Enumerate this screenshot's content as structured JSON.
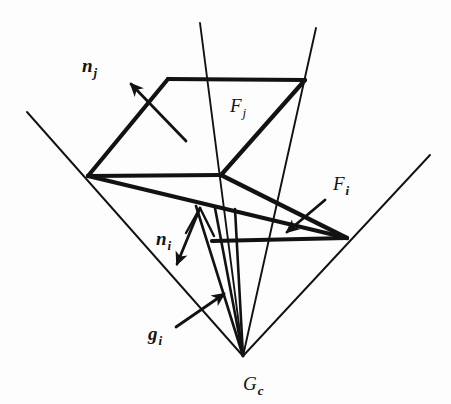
{
  "figure": {
    "background_color": "#fdfdfd",
    "ink_color": "#121212",
    "thick_stroke_width": 4.2,
    "thin_stroke_width": 1.9,
    "labels": [
      {
        "id": "n_j",
        "base": "n",
        "subscript": "j",
        "style": "bold-italic-base-italic-sub",
        "x": 82,
        "y": 72,
        "semantic": "normal-vector-face-j"
      },
      {
        "id": "F_j",
        "base": "F",
        "subscript": "j",
        "style": "italic-base-italic-sub",
        "x": 230,
        "y": 112,
        "semantic": "face-j"
      },
      {
        "id": "F_i",
        "base": "F",
        "subscript": "i",
        "style": "italic-base-bold-sub",
        "x": 333,
        "y": 190,
        "semantic": "face-i"
      },
      {
        "id": "n_i",
        "base": "n",
        "subscript": "i",
        "style": "bold-italic-base-bold-sub",
        "x": 156,
        "y": 245,
        "semantic": "normal-vector-face-i"
      },
      {
        "id": "g_i",
        "base": "g",
        "subscript": "i",
        "style": "bold-italic-base-bold-sub",
        "x": 148,
        "y": 340,
        "semantic": "grasp-direction-i"
      },
      {
        "id": "G_c",
        "base": "G",
        "subscript": "c",
        "style": "italic-base-bold-sub",
        "x": 243,
        "y": 390,
        "semantic": "grasp-center-apex"
      }
    ],
    "vertices": {
      "apex": [
        243,
        356
      ],
      "left": [
        88,
        176
      ],
      "center": [
        221,
        175
      ],
      "top_left": [
        168,
        79
      ],
      "top_right": [
        305,
        80
      ],
      "right": [
        347,
        238
      ],
      "lower_left": [
        212,
        241
      ]
    },
    "thick_edges": [
      {
        "name": "upper-face-top-edge",
        "points": [
          [
            168,
            79
          ],
          [
            305,
            80
          ]
        ]
      },
      {
        "name": "upper-face-left-edge",
        "points": [
          [
            88,
            176
          ],
          [
            168,
            79
          ]
        ]
      },
      {
        "name": "middle-horizontal-edge",
        "points": [
          [
            88,
            176
          ],
          [
            221,
            175
          ]
        ]
      },
      {
        "name": "upper-face-diagonal",
        "points": [
          [
            221,
            175
          ],
          [
            305,
            80
          ]
        ]
      },
      {
        "name": "lower-face-diagonal",
        "points": [
          [
            88,
            176
          ],
          [
            347,
            238
          ]
        ]
      },
      {
        "name": "lower-face-bottom-edge",
        "points": [
          [
            212,
            241
          ],
          [
            347,
            238
          ]
        ]
      },
      {
        "name": "center-to-right-edge",
        "points": [
          [
            221,
            175
          ],
          [
            347,
            238
          ]
        ]
      }
    ],
    "thin_lines": [
      {
        "name": "cone-ray-upper-left-outer",
        "points": [
          [
            27,
            112
          ],
          [
            243,
            356
          ]
        ]
      },
      {
        "name": "cone-ray-left-inner",
        "points": [
          [
            200,
            23
          ],
          [
            243,
            356
          ]
        ]
      },
      {
        "name": "cone-ray-right-inner",
        "points": [
          [
            316,
            28
          ],
          [
            243,
            356
          ]
        ]
      },
      {
        "name": "cone-ray-lower-right-outer",
        "points": [
          [
            430,
            155
          ],
          [
            243,
            356
          ]
        ]
      }
    ],
    "arrows": [
      {
        "name": "normal-arrow-j",
        "from": [
          186,
          141
        ],
        "to": [
          131,
          84
        ],
        "semantic": "n_j-direction"
      },
      {
        "name": "normal-arrow-i",
        "from": [
          200,
          208
        ],
        "to": [
          177,
          264
        ],
        "semantic": "n_i-direction"
      },
      {
        "name": "face-arrow-i",
        "from": [
          325,
          200
        ],
        "to": [
          287,
          232
        ],
        "semantic": "F_i-pointer"
      },
      {
        "name": "grasp-arrow-i",
        "from": [
          176,
          327
        ],
        "to": [
          224,
          294
        ],
        "semantic": "g_i-pointer"
      }
    ],
    "apex_fan_rays": [
      {
        "name": "fan-ray-1",
        "points": [
          [
            243,
            356
          ],
          [
            196,
            206
          ]
        ]
      },
      {
        "name": "fan-ray-2",
        "points": [
          [
            243,
            356
          ],
          [
            215,
            208
          ]
        ]
      },
      {
        "name": "fan-ray-3",
        "points": [
          [
            243,
            356
          ],
          [
            235,
            209
          ]
        ]
      }
    ],
    "normal_i_apex_tick": {
      "name": "n_i-apex-notch",
      "points": [
        [
          186,
          233
        ],
        [
          200,
          208
        ],
        [
          214,
          236
        ]
      ]
    }
  },
  "chart_data": {
    "type": "diagram",
    "elements": [
      {
        "label": "F_j",
        "kind": "contact-face",
        "position": "upper parallelogram"
      },
      {
        "label": "F_i",
        "kind": "contact-face",
        "position": "lower parallelogram"
      },
      {
        "label": "n_j",
        "kind": "normal-vector",
        "direction": "up-left"
      },
      {
        "label": "n_i",
        "kind": "normal-vector",
        "direction": "down-left"
      },
      {
        "label": "g_i",
        "kind": "grasp-direction",
        "direction": "up-right"
      },
      {
        "label": "G_c",
        "kind": "apex-point",
        "position": "bottom center"
      }
    ]
  }
}
